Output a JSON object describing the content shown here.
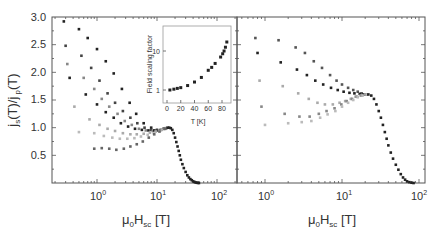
{
  "chart_data": [
    {
      "panel": "left",
      "type": "scatter",
      "xscale": "log",
      "xlim": [
        0.2,
        200
      ],
      "ylim": [
        0,
        3.0
      ],
      "xlabel": {
        "main": "μ",
        "sub0": "0",
        "mid": "H",
        "sub1": "sc",
        "unit": " [T]"
      },
      "ylabel": "j_s(T)/j_p(T)",
      "ylabel_parts": {
        "a": "j",
        "a_sub": "s",
        "b": "(T)/j",
        "b_sub": " p",
        "c": "(T)"
      },
      "yticks": [
        0.5,
        1.0,
        1.5,
        2.0,
        2.5,
        3.0
      ],
      "ytick_labels": [
        "0.5",
        "1.0",
        "1.5",
        "2.0",
        "2.5",
        "3.0"
      ],
      "xticks": [
        1,
        10,
        100
      ],
      "xtick_labels": [
        {
          "base": "10",
          "exp": "0"
        },
        {
          "base": "10",
          "exp": "1"
        },
        {
          "base": "10",
          "exp": "2"
        }
      ],
      "series": [
        {
          "name": "s1",
          "shade": "#222222",
          "x": [
            0.28,
            0.5,
            0.7,
            1.0,
            1.4,
            1.9,
            2.6,
            3.5,
            4.5,
            6,
            8,
            10,
            13
          ],
          "y": [
            2.92,
            2.78,
            2.62,
            2.42,
            2.2,
            1.98,
            1.7,
            1.45,
            1.25,
            1.08,
            1.0,
            0.96,
            0.98
          ]
        },
        {
          "name": "s2",
          "shade": "#444444",
          "x": [
            0.3,
            0.55,
            0.8,
            1.1,
            1.5,
            2.0,
            2.7,
            3.6,
            4.7,
            6.2,
            8,
            10,
            13
          ],
          "y": [
            2.48,
            2.3,
            2.08,
            1.85,
            1.62,
            1.45,
            1.3,
            1.18,
            1.08,
            1.0,
            0.96,
            0.95,
            0.98
          ]
        },
        {
          "name": "s3",
          "shade": "#888888",
          "x": [
            0.32,
            0.6,
            0.9,
            1.2,
            1.6,
            2.2,
            2.9,
            3.8,
            5,
            6.5,
            8.5,
            11,
            14
          ],
          "y": [
            2.15,
            1.9,
            1.7,
            1.52,
            1.38,
            1.25,
            1.12,
            1.05,
            0.98,
            0.95,
            0.94,
            0.95,
            0.98
          ]
        },
        {
          "name": "s4",
          "shade": "#222222",
          "x": [
            0.35,
            0.65,
            1.0,
            1.4,
            1.9,
            2.5,
            3.3,
            4.3,
            5.6,
            7.2,
            9,
            11.5,
            14
          ],
          "y": [
            1.9,
            1.6,
            1.42,
            1.28,
            1.18,
            1.08,
            1.02,
            0.98,
            0.96,
            0.95,
            0.95,
            0.96,
            0.99
          ]
        },
        {
          "name": "s5",
          "shade": "#aaaaaa",
          "x": [
            0.42,
            0.75,
            1.1,
            1.5,
            2.0,
            2.7,
            3.6,
            4.6,
            6,
            7.6,
            9.5,
            12,
            14.5
          ],
          "y": [
            1.38,
            1.15,
            1.05,
            0.98,
            0.94,
            0.9,
            0.88,
            0.88,
            0.89,
            0.91,
            0.93,
            0.96,
            0.99
          ]
        },
        {
          "name": "s6",
          "shade": "#bbbbbb",
          "x": [
            0.5,
            0.9,
            1.3,
            1.8,
            2.4,
            3.2,
            4.2,
            5.4,
            7,
            8.8,
            11,
            13.5
          ],
          "y": [
            0.92,
            0.9,
            0.85,
            0.82,
            0.8,
            0.8,
            0.81,
            0.84,
            0.87,
            0.9,
            0.94,
            0.98
          ]
        },
        {
          "name": "s7",
          "shade": "#666666",
          "x": [
            0.9,
            1.2,
            1.6,
            2.1,
            2.8,
            3.6,
            4.6,
            5.8,
            7.3,
            9,
            11,
            13.5
          ],
          "y": [
            0.62,
            0.63,
            0.62,
            0.6,
            0.62,
            0.66,
            0.7,
            0.75,
            0.82,
            0.88,
            0.93,
            0.98
          ]
        },
        {
          "name": "collapse",
          "shade": "#222222",
          "x": [
            15,
            16,
            17,
            18,
            19,
            20,
            21,
            22,
            23,
            24,
            25,
            26.5,
            28,
            30,
            32,
            34,
            36,
            38,
            40,
            42,
            44,
            46,
            48,
            50
          ],
          "y": [
            1.0,
            1.0,
            0.99,
            0.96,
            0.9,
            0.82,
            0.74,
            0.66,
            0.58,
            0.5,
            0.42,
            0.34,
            0.27,
            0.2,
            0.14,
            0.1,
            0.07,
            0.05,
            0.03,
            0.02,
            0.01,
            0.005,
            0.002,
            0.0
          ]
        }
      ],
      "inset": {
        "type": "scatter",
        "xlabel": "T [K]",
        "ylabel": "Field scaling factor",
        "xlim": [
          0,
          90
        ],
        "ylim": [
          0.7,
          25
        ],
        "yscale": "log",
        "xticks": [
          0,
          20,
          40,
          60,
          80
        ],
        "xtick_labels": [
          "0",
          "20",
          "40",
          "60",
          "80"
        ],
        "yticks": [
          1,
          10
        ],
        "ytick_labels": [
          "1",
          "10"
        ],
        "x": [
          4.2,
          10,
          15,
          20,
          30,
          40,
          50,
          60,
          65,
          70,
          78,
          81,
          83,
          85,
          87
        ],
        "y": [
          1.0,
          1.05,
          1.1,
          1.15,
          1.3,
          1.6,
          2.1,
          3.2,
          3.8,
          4.8,
          7.0,
          8.5,
          10.0,
          12.5,
          17.0
        ]
      }
    },
    {
      "panel": "right",
      "type": "scatter",
      "xscale": "log",
      "xlim": [
        0.5,
        110
      ],
      "ylim": [
        0,
        3.0
      ],
      "xlabel": {
        "main": "μ",
        "sub0": "0",
        "mid": "H",
        "sub1": "sc",
        "unit": " [T]"
      },
      "xticks": [
        1,
        10,
        100
      ],
      "xtick_labels": [
        {
          "base": "10",
          "exp": "0"
        },
        {
          "base": "10",
          "exp": "1"
        },
        {
          "base": "10",
          "exp": "2"
        }
      ],
      "series": [
        {
          "name": "r1",
          "shade": "#555555",
          "x": [
            0.75,
            1.5,
            2.5,
            3.3,
            4.3,
            5.5,
            7,
            8.5,
            10,
            12,
            14,
            16,
            18,
            20
          ],
          "y": [
            2.62,
            2.58,
            2.45,
            2.35,
            2.2,
            2.08,
            1.95,
            1.85,
            1.78,
            1.72,
            1.68,
            1.65,
            1.62,
            1.6
          ]
        },
        {
          "name": "r2",
          "shade": "#222222",
          "x": [
            0.8,
            1.6,
            2.6,
            3.5,
            4.5,
            5.7,
            7.2,
            8.8,
            10.5,
            12.5,
            14.5,
            17,
            19,
            21
          ],
          "y": [
            2.35,
            2.18,
            2.05,
            1.95,
            1.85,
            1.78,
            1.72,
            1.68,
            1.65,
            1.63,
            1.62,
            1.61,
            1.6,
            1.6
          ]
        },
        {
          "name": "r3",
          "shade": "#aaaaaa",
          "x": [
            0.85,
            1.7,
            2.7,
            3.7,
            4.8,
            6,
            7.6,
            9.3,
            11,
            13,
            15,
            17.5,
            20
          ],
          "y": [
            1.85,
            1.75,
            1.62,
            1.52,
            1.45,
            1.42,
            1.42,
            1.45,
            1.48,
            1.52,
            1.56,
            1.58,
            1.6
          ]
        },
        {
          "name": "r4",
          "shade": "#888888",
          "x": [
            0.9,
            1.8,
            2.8,
            3.8,
            5,
            6.3,
            8,
            9.8,
            11.5,
            13.5,
            15.5,
            18,
            20.5
          ],
          "y": [
            1.38,
            1.25,
            1.2,
            1.2,
            1.25,
            1.3,
            1.35,
            1.42,
            1.48,
            1.52,
            1.56,
            1.58,
            1.6
          ]
        },
        {
          "name": "r5",
          "shade": "#bbbbbb",
          "x": [
            1.0,
            2.0,
            3.0,
            4.0,
            5.2,
            6.5,
            8.2,
            10,
            12,
            14,
            16,
            18.5,
            21
          ],
          "y": [
            1.05,
            1.08,
            1.1,
            1.12,
            1.18,
            1.24,
            1.3,
            1.38,
            1.45,
            1.5,
            1.55,
            1.58,
            1.6
          ]
        },
        {
          "name": "collapse",
          "shade": "#222222",
          "x": [
            22,
            24,
            26,
            28,
            30,
            32,
            34,
            36,
            38,
            40,
            43,
            46,
            50,
            54,
            58,
            62,
            66,
            70,
            75,
            80,
            85
          ],
          "y": [
            1.6,
            1.58,
            1.52,
            1.42,
            1.3,
            1.18,
            1.05,
            0.92,
            0.8,
            0.68,
            0.55,
            0.44,
            0.33,
            0.24,
            0.16,
            0.1,
            0.06,
            0.03,
            0.015,
            0.005,
            0.0
          ]
        }
      ]
    }
  ]
}
